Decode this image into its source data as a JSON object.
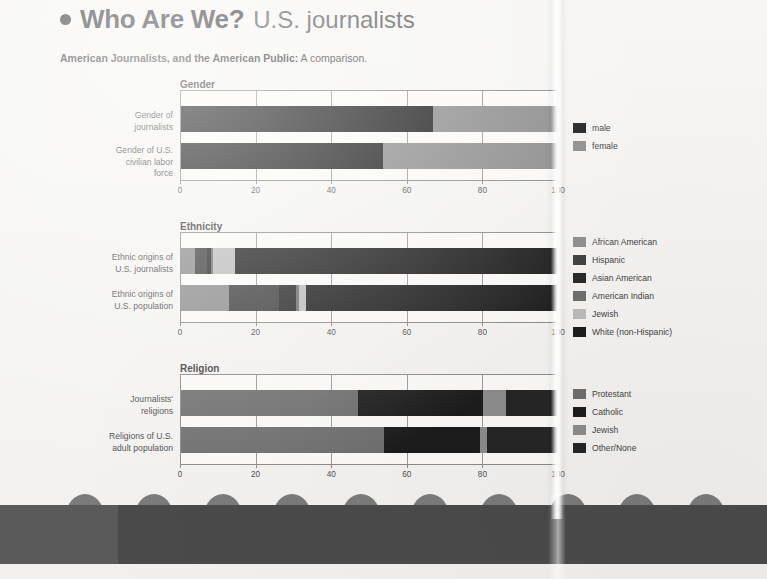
{
  "header": {
    "bullet": "bullet-dot",
    "title_bold": "Who Are We?",
    "title_light": "U.S. journalists",
    "subhead_bold": "American Journalists, and the American Public:",
    "subhead_normal": " A comparison."
  },
  "colors": {
    "black": "#1c1c1c",
    "dark": "#262626",
    "mid_dark": "#3d3d3d",
    "mid": "#6e6e6e",
    "gray": "#8c8c8c",
    "light_gray": "#a8a8a8",
    "pale_gray": "#bcbcbc",
    "plot_bg": "#fbfaf8",
    "axis": "#8b8b8b",
    "band": "#4a4a4a",
    "circle": "#7b7b7b"
  },
  "axis": {
    "ticks": [
      "0",
      "20",
      "40",
      "60",
      "80",
      "100"
    ],
    "min": 0,
    "max": 100
  },
  "chart_data": [
    {
      "type": "bar",
      "orientation": "horizontal",
      "stacked": true,
      "title": "Gender",
      "xlabel": "",
      "ylabel": "",
      "xlim": [
        0,
        100
      ],
      "xticks": [
        0,
        20,
        40,
        60,
        80,
        100
      ],
      "grid": true,
      "legend_position": "right",
      "categories": [
        "Gender of journalists",
        "Gender of U.S. civilian labor force"
      ],
      "series": [
        {
          "name": "male",
          "color": "#1c1c1c",
          "values": [
            66.6,
            53.4
          ]
        },
        {
          "name": "female",
          "color": "#8c8c8c",
          "values": [
            33.4,
            46.6
          ]
        }
      ]
    },
    {
      "type": "bar",
      "orientation": "horizontal",
      "stacked": true,
      "title": "Ethnicity",
      "xlabel": "",
      "ylabel": "",
      "xlim": [
        0,
        100
      ],
      "xticks": [
        0,
        20,
        40,
        60,
        80,
        100
      ],
      "grid": true,
      "legend_position": "right",
      "categories": [
        "Ethnic origins of U.S. journalists",
        "Ethnic origins of U.S. population"
      ],
      "series": [
        {
          "name": "African American",
          "color": "#8c8c8c",
          "values": [
            3.7,
            12.8
          ]
        },
        {
          "name": "Hispanic",
          "color": "#3d3d3d",
          "values": [
            3.3,
            13.2
          ]
        },
        {
          "name": "Asian American",
          "color": "#262626",
          "values": [
            1.0,
            4.3
          ]
        },
        {
          "name": "American Indian",
          "color": "#6e6e6e",
          "values": [
            0.4,
            1.0
          ]
        },
        {
          "name": "Jewish",
          "color": "#bcbcbc",
          "values": [
            6.0,
            1.8
          ]
        },
        {
          "name": "White (non-Hispanic)",
          "color": "#1c1c1c",
          "values": [
            85.6,
            66.9
          ]
        }
      ]
    },
    {
      "type": "bar",
      "orientation": "horizontal",
      "stacked": true,
      "title": "Religion",
      "xlabel": "",
      "ylabel": "",
      "xlim": [
        0,
        100
      ],
      "xticks": [
        0,
        20,
        40,
        60,
        80,
        100
      ],
      "grid": true,
      "legend_position": "right",
      "categories": [
        "Journalists' religions",
        "Religions of U.S. adult population"
      ],
      "series": [
        {
          "name": "Protestant",
          "color": "#6e6e6e",
          "values": [
            46.8,
            53.6
          ]
        },
        {
          "name": "Catholic",
          "color": "#1c1c1c",
          "values": [
            33.0,
            25.6
          ]
        },
        {
          "name": "Jewish",
          "color": "#8c8c8c",
          "values": [
            6.2,
            1.8
          ]
        },
        {
          "name": "Other/None",
          "color": "#262626",
          "values": [
            14.0,
            19.0
          ]
        }
      ]
    }
  ],
  "charts": [
    {
      "id": "gender",
      "title": "Gender",
      "rows": [
        {
          "label_lines": [
            "Gender of",
            "journalists"
          ]
        },
        {
          "label_lines": [
            "Gender of U.S.",
            "civilian labor",
            "force"
          ]
        }
      ],
      "legend": [
        {
          "label": "male",
          "color": "#1c1c1c"
        },
        {
          "label": "female",
          "color": "#8c8c8c"
        }
      ]
    },
    {
      "id": "ethnicity",
      "title": "Ethnicity",
      "rows": [
        {
          "label_lines": [
            "Ethnic origins of",
            "U.S. journalists"
          ]
        },
        {
          "label_lines": [
            "Ethnic origins of",
            "U.S. population"
          ]
        }
      ],
      "legend": [
        {
          "label": "African American",
          "color": "#8c8c8c"
        },
        {
          "label": "Hispanic",
          "color": "#3d3d3d"
        },
        {
          "label": "Asian American",
          "color": "#262626"
        },
        {
          "label": "American Indian",
          "color": "#6e6e6e"
        },
        {
          "label": "Jewish",
          "color": "#bcbcbc"
        },
        {
          "label": "White (non-Hispanic)",
          "color": "#1c1c1c"
        }
      ]
    },
    {
      "id": "religion",
      "title": "Religion",
      "rows": [
        {
          "label_lines": [
            "Journalists'",
            "religions"
          ]
        },
        {
          "label_lines": [
            "Religions of U.S.",
            "adult population"
          ]
        }
      ],
      "legend": [
        {
          "label": "Protestant",
          "color": "#6e6e6e"
        },
        {
          "label": "Catholic",
          "color": "#1c1c1c"
        },
        {
          "label": "Jewish",
          "color": "#8c8c8c"
        },
        {
          "label": "Other/None",
          "color": "#262626"
        }
      ]
    }
  ],
  "footer_band": {
    "circle_count": 10
  }
}
